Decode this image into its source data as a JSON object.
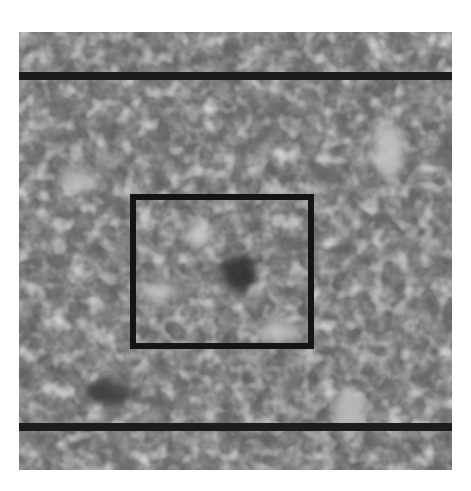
{
  "figure": {
    "kind": "grayscale micrograph",
    "image_region": {
      "x": 19,
      "y": 32,
      "width": 433,
      "height": 438
    },
    "dark_bands": [
      {
        "y": 72,
        "height": 8
      },
      {
        "y": 423,
        "height": 8
      }
    ],
    "region_of_interest_box": {
      "x": 130,
      "y": 194,
      "width": 184,
      "height": 155,
      "border_color": "#141414",
      "border_width": 6
    },
    "colors": {
      "background": "#ffffff",
      "mid_gray": "#7a7a7a",
      "dark": "#1c1c1c",
      "light": "#c8c8c8"
    }
  }
}
